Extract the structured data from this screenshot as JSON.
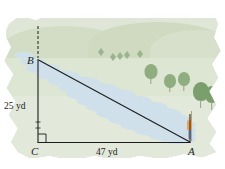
{
  "figure": {
    "type": "right-triangle-over-landscape",
    "vertices": [
      {
        "name": "B",
        "label": "B",
        "x": 38,
        "y": 60,
        "role": "top-left-vertex"
      },
      {
        "name": "C",
        "label": "C",
        "x": 38,
        "y": 142,
        "role": "right-angle-vertex"
      },
      {
        "name": "A",
        "label": "A",
        "x": 190,
        "y": 142,
        "role": "bottom-right-vertex"
      }
    ],
    "measures": {
      "vertical_leg": "25 yd",
      "horizontal_leg": "47 yd",
      "vertical_leg_value": 25,
      "horizontal_leg_value": 47,
      "units": "yd"
    },
    "right_angle_marker": {
      "at": "C",
      "shown": true
    },
    "hypotenuse": {
      "from": "B",
      "to": "A",
      "labeled": false
    }
  },
  "scene": {
    "sky_label": "sky",
    "river_label": "river",
    "hills_label": "rolling hills",
    "person_label": "person standing at point A",
    "trees_label": "trees",
    "clouds_label": "clouds"
  },
  "colors": {
    "line": "#1c1c1c",
    "water": "#cfe0ea",
    "grass": "#dde5d3",
    "hill": "#d3ddc6",
    "tree": "#8fae80",
    "tree_dark": "#7a9e6c",
    "person_shirt": "#e8a257",
    "sky": "#ffffff",
    "page": "#ffffff"
  },
  "trees": [
    {
      "id": "t1",
      "x": 150,
      "y": 72,
      "size": "medium"
    },
    {
      "id": "t2",
      "x": 168,
      "y": 82,
      "size": "medium"
    },
    {
      "id": "t3",
      "x": 182,
      "y": 80,
      "size": "medium"
    },
    {
      "id": "t4",
      "x": 199,
      "y": 92,
      "size": "large"
    },
    {
      "id": "t5",
      "x": 208,
      "y": 96,
      "size": "large"
    }
  ],
  "mini_trees": [
    {
      "id": "m1",
      "x": 98,
      "y": 48
    },
    {
      "id": "m2",
      "x": 110,
      "y": 53
    },
    {
      "id": "m3",
      "x": 117,
      "y": 52
    },
    {
      "id": "m4",
      "x": 124,
      "y": 51
    },
    {
      "id": "m5",
      "x": 137,
      "y": 50
    }
  ]
}
